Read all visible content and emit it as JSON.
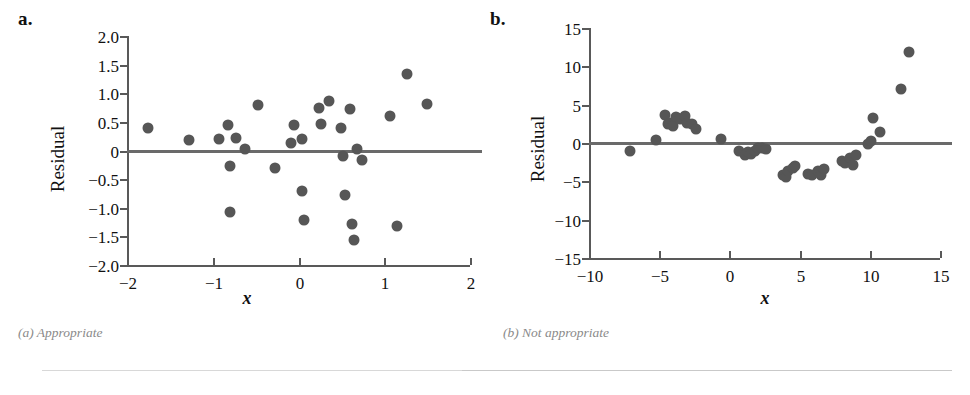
{
  "figure": {
    "background_color": "#ffffff",
    "dot_color": "#565656",
    "axis_color": "#595959",
    "caption_color": "#8a8a8a"
  },
  "panels": [
    {
      "id": "a",
      "label": "a.",
      "caption": "(a) Appropriate",
      "chart_data": {
        "type": "scatter",
        "title": "",
        "xlabel": "x",
        "ylabel": "Residual",
        "xlim": [
          -2,
          2
        ],
        "ylim": [
          -2.0,
          2.0
        ],
        "xticks": [
          -2,
          -1,
          0,
          1,
          2
        ],
        "xticklabels": [
          "−2",
          "−1",
          "0",
          "1",
          "2"
        ],
        "yticks": [
          2.0,
          1.5,
          1.0,
          0.5,
          0,
          -0.5,
          -1.0,
          -1.5,
          -2.0
        ],
        "yticklabels": [
          "2.0",
          "1.5",
          "1.0",
          "0.5",
          "0",
          "−0.5",
          "−1.0",
          "−1.5",
          "−2.0"
        ],
        "grid": false,
        "legend": "none",
        "reference_line_y": 0,
        "points": [
          [
            -1.76,
            0.4
          ],
          [
            -1.28,
            0.19
          ],
          [
            -0.93,
            0.21
          ],
          [
            -0.82,
            0.44
          ],
          [
            -0.8,
            -0.27
          ],
          [
            -0.8,
            -1.08
          ],
          [
            -0.73,
            0.22
          ],
          [
            -0.62,
            0.03
          ],
          [
            -0.47,
            0.79
          ],
          [
            -0.28,
            -0.3
          ],
          [
            -0.09,
            0.13
          ],
          [
            -0.05,
            0.45
          ],
          [
            0.04,
            0.21
          ],
          [
            0.04,
            -0.7
          ],
          [
            0.06,
            -1.21
          ],
          [
            0.24,
            0.75
          ],
          [
            0.26,
            0.46
          ],
          [
            0.35,
            0.86
          ],
          [
            0.5,
            0.39
          ],
          [
            0.52,
            -0.1
          ],
          [
            0.54,
            -0.77
          ],
          [
            0.6,
            0.73
          ],
          [
            0.62,
            -1.29
          ],
          [
            0.65,
            -1.56
          ],
          [
            0.68,
            0.02
          ],
          [
            0.74,
            -0.16
          ],
          [
            1.07,
            0.6
          ],
          [
            1.15,
            -1.31
          ],
          [
            1.26,
            1.34
          ],
          [
            1.5,
            0.81
          ]
        ]
      }
    },
    {
      "id": "b",
      "label": "b.",
      "caption": "(b) Not appropriate",
      "chart_data": {
        "type": "scatter",
        "title": "",
        "xlabel": "x",
        "ylabel": "Residual",
        "xlim": [
          -10,
          15
        ],
        "ylim": [
          -15,
          15
        ],
        "xticks": [
          -10,
          -5,
          0,
          5,
          10,
          15
        ],
        "xticklabels": [
          "−10",
          "−5",
          "0",
          "5",
          "10",
          "15"
        ],
        "yticks": [
          15,
          10,
          5,
          0,
          -5,
          -10,
          -15
        ],
        "yticklabels": [
          "15",
          "10",
          "5",
          "0",
          "−5",
          "−10",
          "−15"
        ],
        "grid": false,
        "legend": "none",
        "reference_line_y": 0,
        "points": [
          [
            -7.1,
            -1.0
          ],
          [
            -5.2,
            0.4
          ],
          [
            -4.6,
            3.6
          ],
          [
            -4.4,
            2.5
          ],
          [
            -4.2,
            2.6
          ],
          [
            -4.0,
            2.2
          ],
          [
            -3.8,
            3.4
          ],
          [
            -3.5,
            3.1
          ],
          [
            -3.2,
            3.5
          ],
          [
            -3.0,
            2.6
          ],
          [
            -2.7,
            2.5
          ],
          [
            -2.4,
            1.8
          ],
          [
            -0.6,
            0.5
          ],
          [
            0.7,
            -1.1
          ],
          [
            1.1,
            -1.6
          ],
          [
            1.3,
            -1.2
          ],
          [
            1.5,
            -1.4
          ],
          [
            1.8,
            -1.0
          ],
          [
            2.0,
            -0.6
          ],
          [
            2.3,
            -0.7
          ],
          [
            2.6,
            -0.8
          ],
          [
            3.8,
            -4.2
          ],
          [
            4.0,
            -4.4
          ],
          [
            4.2,
            -3.6
          ],
          [
            4.5,
            -3.3
          ],
          [
            4.7,
            -3.0
          ],
          [
            5.6,
            -4.1
          ],
          [
            5.9,
            -4.2
          ],
          [
            6.3,
            -3.7
          ],
          [
            6.5,
            -4.2
          ],
          [
            6.7,
            -3.4
          ],
          [
            8.0,
            -2.3
          ],
          [
            8.2,
            -2.6
          ],
          [
            8.6,
            -2.0
          ],
          [
            8.8,
            -2.8
          ],
          [
            9.0,
            -1.6
          ],
          [
            9.9,
            -0.1
          ],
          [
            10.1,
            0.3
          ],
          [
            10.2,
            3.3
          ],
          [
            10.7,
            1.4
          ],
          [
            12.2,
            7.0
          ],
          [
            12.8,
            11.9
          ]
        ]
      }
    }
  ]
}
